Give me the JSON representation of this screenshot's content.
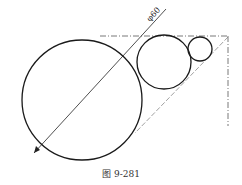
{
  "figure": {
    "caption": "图 9-281",
    "dimension_label": "φ60",
    "colors": {
      "stroke": "#1a1a1a",
      "construction": "#555555",
      "background": "#ffffff"
    },
    "circles": [
      {
        "name": "large-circle",
        "cx": 82,
        "cy": 100,
        "r": 60
      },
      {
        "name": "medium-circle",
        "cx": 164,
        "cy": 62,
        "r": 27
      },
      {
        "name": "small-circle",
        "cx": 200,
        "cy": 49,
        "r": 12
      }
    ]
  }
}
